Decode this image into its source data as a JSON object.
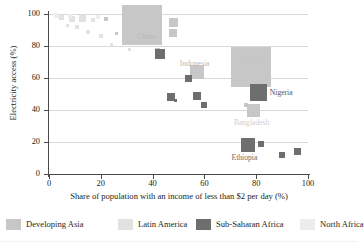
{
  "chart_data": {
    "type": "scatter",
    "title": "",
    "xlabel": "Share of population with an income of less than $2 per day (%)",
    "ylabel": "Electricity access (%)",
    "xlim": [
      0,
      100
    ],
    "ylim": [
      0,
      100
    ],
    "xticks": [
      0,
      20,
      40,
      60,
      80,
      100
    ],
    "yticks": [
      0,
      20,
      40,
      60,
      80,
      100
    ],
    "grid": "horizontal",
    "marker": "square sized by population",
    "legend_position": "bottom",
    "series": [
      {
        "name": "Developing Asia",
        "color": "#c7c7c7",
        "points": [
          {
            "label": "China",
            "x": 36,
            "y": 93,
            "size": 40
          },
          {
            "label": "India",
            "x": 78,
            "y": 67,
            "size": 40
          },
          {
            "label": "Indonesia",
            "x": 57,
            "y": 64,
            "size": 14
          },
          {
            "label": "Bangladesh",
            "x": 79,
            "y": 40,
            "size": 13
          },
          {
            "label": "",
            "x": 48,
            "y": 95,
            "size": 9
          },
          {
            "label": "",
            "x": 48,
            "y": 88,
            "size": 8
          },
          {
            "label": "",
            "x": 42,
            "y": 77,
            "size": 5
          },
          {
            "label": "",
            "x": 22,
            "y": 97,
            "size": 4
          },
          {
            "label": "",
            "x": 29,
            "y": 96,
            "size": 4
          },
          {
            "label": "",
            "x": 34,
            "y": 97,
            "size": 3
          },
          {
            "label": "",
            "x": 26,
            "y": 88,
            "size": 3
          },
          {
            "label": "",
            "x": 76,
            "y": 43,
            "size": 4
          }
        ]
      },
      {
        "name": "Latin America",
        "color": "#e2e2e2",
        "points": [
          {
            "label": "",
            "x": 5,
            "y": 98,
            "size": 5
          },
          {
            "label": "",
            "x": 9,
            "y": 97,
            "size": 6
          },
          {
            "label": "",
            "x": 13,
            "y": 97,
            "size": 7
          },
          {
            "label": "",
            "x": 17,
            "y": 96,
            "size": 4
          },
          {
            "label": "",
            "x": 11,
            "y": 92,
            "size": 4
          },
          {
            "label": "",
            "x": 15,
            "y": 89,
            "size": 4
          },
          {
            "label": "",
            "x": 20,
            "y": 86,
            "size": 4
          },
          {
            "label": "",
            "x": 7,
            "y": 93,
            "size": 3
          },
          {
            "label": "",
            "x": 24,
            "y": 81,
            "size": 3
          },
          {
            "label": "",
            "x": 31,
            "y": 78,
            "size": 3
          }
        ]
      },
      {
        "name": "Sub-Saharan Africa",
        "color": "#6e6e6e",
        "points": [
          {
            "label": "Nigeria",
            "x": 81,
            "y": 51,
            "size": 17
          },
          {
            "label": "Ethiopia",
            "x": 77,
            "y": 18,
            "size": 14
          },
          {
            "label": "",
            "x": 43,
            "y": 75,
            "size": 10
          },
          {
            "label": "",
            "x": 54,
            "y": 60,
            "size": 7
          },
          {
            "label": "",
            "x": 57,
            "y": 49,
            "size": 8
          },
          {
            "label": "",
            "x": 47,
            "y": 48,
            "size": 8
          },
          {
            "label": "",
            "x": 60,
            "y": 43,
            "size": 6
          },
          {
            "label": "",
            "x": 49,
            "y": 46,
            "size": 3
          },
          {
            "label": "",
            "x": 82,
            "y": 19,
            "size": 6
          },
          {
            "label": "",
            "x": 90,
            "y": 12,
            "size": 6
          },
          {
            "label": "",
            "x": 96,
            "y": 14,
            "size": 7
          }
        ]
      },
      {
        "name": "North Africa",
        "color": "#ededed",
        "points": [
          {
            "label": "",
            "x": 3,
            "y": 99,
            "size": 5
          },
          {
            "label": "",
            "x": 8,
            "y": 99,
            "size": 4
          },
          {
            "label": "",
            "x": 19,
            "y": 98,
            "size": 4
          }
        ]
      }
    ]
  },
  "legend": {
    "items": [
      {
        "label": "Developing Asia",
        "color": "#c7c7c7"
      },
      {
        "label": "Latin America",
        "color": "#e2e2e2"
      },
      {
        "label": "Sub-Saharan Africa",
        "color": "#6e6e6e"
      },
      {
        "label": "North Africa",
        "color": "#ededed"
      }
    ]
  }
}
